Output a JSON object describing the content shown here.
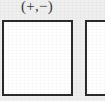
{
  "figure": {
    "background_color": "#efefef",
    "panels": [
      {
        "name": "panel-left",
        "sign_label": "(+,−)",
        "fill_color": "#ffffff",
        "border_color": "#2b2b2b",
        "border_width_px": 2,
        "content": "",
        "clipped": false
      },
      {
        "name": "panel-right",
        "sign_label": "",
        "fill_color": "#ffffff",
        "border_color": "#2b2b2b",
        "border_width_px": 2,
        "content": "",
        "clipped": true
      }
    ]
  }
}
